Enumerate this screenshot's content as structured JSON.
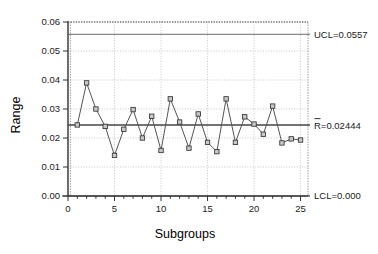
{
  "chart_data": {
    "type": "line",
    "title": "",
    "subtitle": "",
    "xlabel": "Subgroups",
    "ylabel": "Range",
    "xlim": [
      0,
      25.8
    ],
    "ylim": [
      0,
      0.06
    ],
    "grid": true,
    "legend": "none",
    "x": [
      1,
      2,
      3,
      4,
      5,
      6,
      7,
      8,
      9,
      10,
      11,
      12,
      13,
      14,
      15,
      16,
      17,
      18,
      19,
      20,
      21,
      22,
      23,
      24,
      25
    ],
    "series": [
      {
        "name": "Range",
        "marker": "square",
        "values": [
          0.0245,
          0.039,
          0.03,
          0.024,
          0.014,
          0.023,
          0.0298,
          0.02,
          0.0275,
          0.0157,
          0.0335,
          0.0255,
          0.0165,
          0.0283,
          0.0185,
          0.0153,
          0.0335,
          0.0185,
          0.0273,
          0.0248,
          0.0213,
          0.031,
          0.0183,
          0.0197,
          0.0193
        ]
      }
    ],
    "xticks": [
      0,
      5,
      10,
      15,
      20,
      25
    ],
    "xtick_labels": [
      "0",
      "5",
      "10",
      "15",
      "20",
      "25"
    ],
    "yticks": [
      0.0,
      0.01,
      0.02,
      0.03,
      0.04,
      0.05,
      0.06
    ],
    "ytick_labels": [
      "0.00",
      "0.01",
      "0.02",
      "0.03",
      "0.04",
      "0.05",
      "0.06"
    ],
    "control_lines": [
      {
        "id": "ucl",
        "label": "UCL=0.0557",
        "value": 0.0557
      },
      {
        "id": "center",
        "label": "R=0.02444",
        "value": 0.02444,
        "overbar": true
      },
      {
        "id": "lcl",
        "label": "LCL=0.000",
        "value": 0.0
      }
    ],
    "colors": {
      "line": "#555555",
      "marker_face": "#c8c8c8",
      "marker_edge": "#333333",
      "center_line": "#444444",
      "ucl_line": "#888888",
      "lcl_line": "#555555",
      "grid": "#bbbbbb",
      "frame": "#666666",
      "axis": "#333333",
      "background": "#ffffff"
    }
  }
}
